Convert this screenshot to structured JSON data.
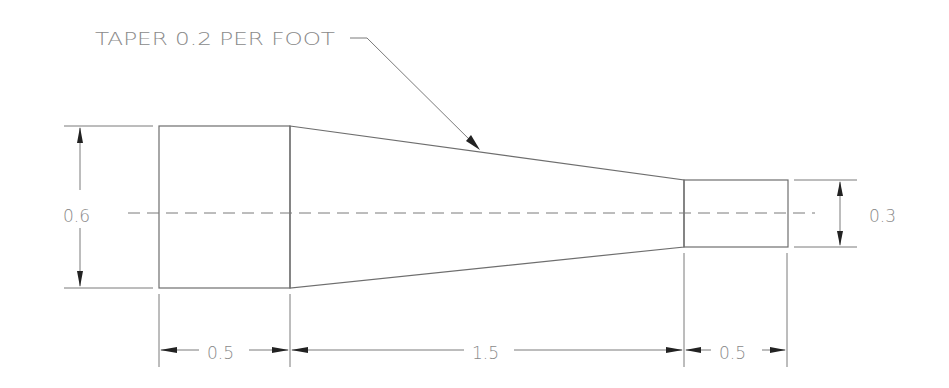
{
  "drawing": {
    "title": "Tapered shaft",
    "note": {
      "text": "TAPER 0.2 PER FOOT",
      "x": 87,
      "y": 45
    },
    "colors": {
      "line": "#6e6e6e",
      "text": "#8a8a8a",
      "arrow": "#222222",
      "background": "#ffffff"
    },
    "dimensions": {
      "left_height": {
        "text": "0.6",
        "x": 86,
        "y": 222
      },
      "right_height": {
        "text": "0.3",
        "x": 888,
        "y": 222
      },
      "left_length": {
        "text": "0.5",
        "x": 224,
        "y": 359
      },
      "taper_length": {
        "text": "1.5",
        "x": 489,
        "y": 359
      },
      "right_length": {
        "text": "0.5",
        "x": 737,
        "y": 359
      }
    }
  }
}
